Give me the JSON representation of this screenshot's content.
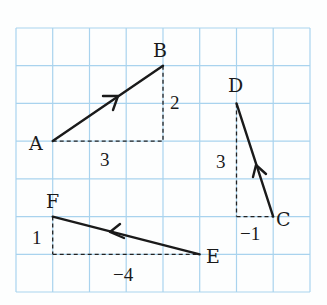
{
  "diagram": {
    "type": "vectors-on-grid",
    "grid": {
      "columns": 8,
      "rows": 7,
      "line_color": "#a9d3ee"
    },
    "vectors": [
      {
        "name": "AB",
        "from": "A",
        "to": "B",
        "dx": 3,
        "dy": 2
      },
      {
        "name": "CD",
        "from": "C",
        "to": "D",
        "dx": -1,
        "dy": 3
      },
      {
        "name": "EF",
        "from": "E",
        "to": "F",
        "dx": -4,
        "dy": 1
      }
    ],
    "points": {
      "A": "A",
      "B": "B",
      "C": "C",
      "D": "D",
      "E": "E",
      "F": "F"
    },
    "component_labels": {
      "ab_horizontal": "3",
      "ab_vertical": "2",
      "cd_vertical": "3",
      "cd_horizontal": "−1",
      "ef_vertical": "1",
      "ef_horizontal": "−4"
    }
  }
}
